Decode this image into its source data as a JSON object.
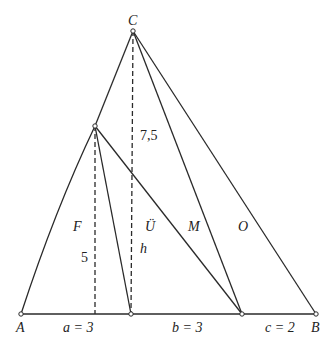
{
  "diagram": {
    "points": {
      "A": "A",
      "B": "B",
      "C": "C"
    },
    "region_labels": {
      "F": "F",
      "U": "Ü",
      "M": "M",
      "O": "O"
    },
    "measures": {
      "height_C": "7,5",
      "height_P": "5",
      "h": "h",
      "a": "a = 3",
      "b": "b = 3",
      "c": "c = 2"
    }
  }
}
